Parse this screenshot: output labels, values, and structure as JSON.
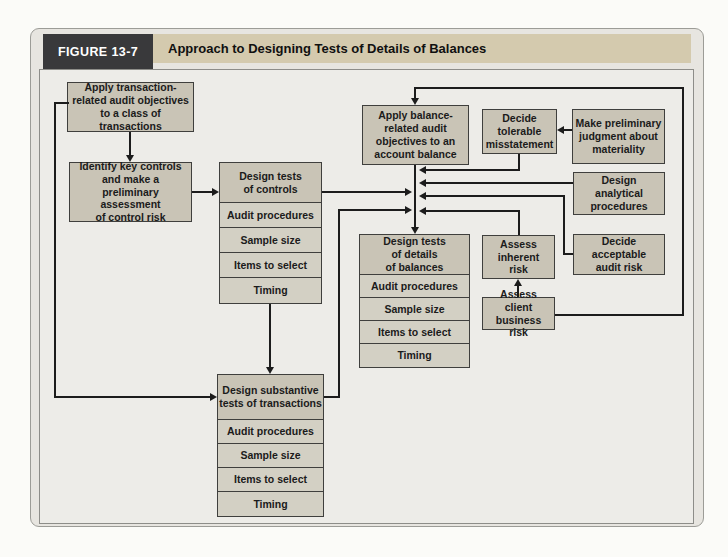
{
  "figure": {
    "label": "FIGURE 13-7",
    "title": "Approach to Designing Tests of Details of Balances"
  },
  "nodes": {
    "apply_transaction": "Apply transaction-\nrelated audit objectives\nto a class of transactions",
    "identify_key_controls": "Identify key controls\nand make a\npreliminary assessment\nof control risk",
    "apply_balance": "Apply balance-\nrelated audit\nobjectives to an\naccount balance",
    "decide_tolerable": "Decide\ntolerable\nmisstatement",
    "make_preliminary": "Make preliminary\njudgment about\nmateriality",
    "design_analytical": "Design\nanalytical\nprocedures",
    "decide_acceptable": "Decide\nacceptable\naudit risk",
    "assess_inherent": "Assess\ninherent\nrisk",
    "assess_client": "Assess client\nbusiness risk"
  },
  "stacks": {
    "controls": {
      "header": "Design tests\nof controls",
      "rows": [
        "Audit procedures",
        "Sample size",
        "Items to select",
        "Timing"
      ]
    },
    "substantive": {
      "header": "Design substantive\ntests of transactions",
      "rows": [
        "Audit procedures",
        "Sample size",
        "Items to select",
        "Timing"
      ]
    },
    "details": {
      "header": "Design tests\nof details\nof balances",
      "rows": [
        "Audit procedures",
        "Sample size",
        "Items to select",
        "Timing"
      ]
    }
  },
  "colors": {
    "figure_label_bg": "#39393b",
    "figure_label_text": "#ffffff",
    "title_strip_bg": "#d4caae",
    "node_fill": "#c9c4b6",
    "stack_row_fill": "#d3d0c4",
    "diagram_bg": "#edece8",
    "line_color": "#1c1c1c"
  }
}
